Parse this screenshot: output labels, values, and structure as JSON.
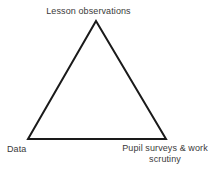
{
  "diagram": {
    "type": "triangle",
    "shape": {
      "stroke_color": "#1a1a1a",
      "stroke_width": 2,
      "fill_color": "#ffffff",
      "vertices": [
        {
          "id": "apex",
          "x": 96,
          "y": 21
        },
        {
          "id": "bottom-left",
          "x": 28,
          "y": 139
        },
        {
          "id": "bottom-right",
          "x": 166,
          "y": 139
        }
      ]
    },
    "labels": {
      "top": "Lesson observations",
      "bottom_left": "Data",
      "bottom_right_line1": "Pupil surveys & work",
      "bottom_right_line2": "scrutiny",
      "text_color": "#3a3a3a"
    },
    "background_color": "#ffffff"
  }
}
